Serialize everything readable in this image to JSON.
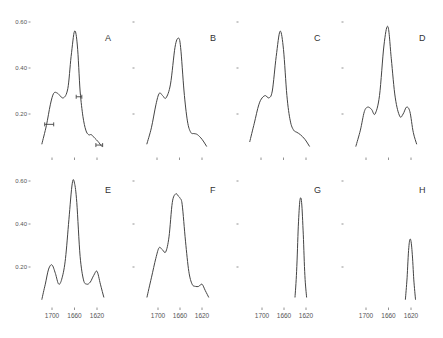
{
  "chart_data": {
    "type": "line",
    "title": "",
    "xlabel": "",
    "ylabel": "",
    "y_ticks": [
      "0.60",
      "0.40",
      "0.20"
    ],
    "x_ticks": [
      "1700",
      "1660",
      "1620"
    ],
    "x_tick_values": [
      1700,
      1660,
      1620
    ],
    "y_tick_values": [
      0.6,
      0.4,
      0.2
    ],
    "xlim": [
      1720,
      1605
    ],
    "ylim": [
      0.05,
      0.62
    ],
    "grid": false,
    "legend": null,
    "panels": [
      {
        "label": "A",
        "row": 0,
        "col": 0,
        "show_y_labels": true,
        "show_x_labels": false,
        "x": [
          1718,
          1710,
          1703,
          1697,
          1690,
          1680,
          1672,
          1666,
          1660,
          1655,
          1650,
          1645,
          1640,
          1635,
          1630,
          1624,
          1618,
          1612
        ],
        "y": [
          0.07,
          0.15,
          0.24,
          0.29,
          0.29,
          0.27,
          0.31,
          0.45,
          0.56,
          0.5,
          0.3,
          0.19,
          0.13,
          0.11,
          0.11,
          0.095,
          0.08,
          0.06
        ],
        "error_bars": [
          {
            "x": 1705,
            "y": 0.155,
            "xerr": 8
          },
          {
            "x": 1652,
            "y": 0.275,
            "xerr": 5
          },
          {
            "x": 1616,
            "y": 0.065,
            "xerr": 6
          }
        ]
      },
      {
        "label": "B",
        "row": 0,
        "col": 1,
        "show_y_labels": false,
        "show_x_labels": false,
        "x": [
          1718,
          1710,
          1702,
          1696,
          1690,
          1684,
          1676,
          1668,
          1662,
          1658,
          1652,
          1646,
          1640,
          1634,
          1628,
          1620,
          1612
        ],
        "y": [
          0.07,
          0.14,
          0.24,
          0.29,
          0.28,
          0.27,
          0.33,
          0.49,
          0.53,
          0.49,
          0.3,
          0.17,
          0.12,
          0.115,
          0.11,
          0.09,
          0.06
        ],
        "error_bars": []
      },
      {
        "label": "C",
        "row": 0,
        "col": 2,
        "show_y_labels": false,
        "show_x_labels": false,
        "x": [
          1720,
          1712,
          1704,
          1698,
          1692,
          1686,
          1680,
          1673,
          1666,
          1660,
          1654,
          1648,
          1642,
          1636,
          1630,
          1622,
          1614
        ],
        "y": [
          0.08,
          0.16,
          0.24,
          0.27,
          0.28,
          0.27,
          0.3,
          0.45,
          0.56,
          0.48,
          0.28,
          0.17,
          0.13,
          0.12,
          0.11,
          0.09,
          0.06
        ],
        "error_bars": []
      },
      {
        "label": "D",
        "row": 0,
        "col": 3,
        "show_y_labels": false,
        "show_x_labels": false,
        "x": [
          1718,
          1710,
          1703,
          1697,
          1690,
          1684,
          1676,
          1668,
          1661,
          1655,
          1648,
          1640,
          1634,
          1628,
          1622,
          1616,
          1610
        ],
        "y": [
          0.06,
          0.13,
          0.21,
          0.23,
          0.22,
          0.2,
          0.28,
          0.5,
          0.58,
          0.44,
          0.27,
          0.19,
          0.2,
          0.23,
          0.21,
          0.12,
          0.07
        ],
        "error_bars": []
      },
      {
        "label": "E",
        "row": 1,
        "col": 0,
        "show_y_labels": true,
        "show_x_labels": true,
        "x": [
          1718,
          1712,
          1706,
          1700,
          1694,
          1688,
          1682,
          1676,
          1670,
          1664,
          1660,
          1656,
          1650,
          1644,
          1638,
          1632,
          1626,
          1620,
          1614,
          1608
        ],
        "y": [
          0.05,
          0.12,
          0.19,
          0.21,
          0.17,
          0.12,
          0.15,
          0.24,
          0.42,
          0.59,
          0.59,
          0.5,
          0.25,
          0.14,
          0.12,
          0.13,
          0.16,
          0.18,
          0.12,
          0.06
        ],
        "error_bars": []
      },
      {
        "label": "F",
        "row": 1,
        "col": 1,
        "show_y_labels": false,
        "show_x_labels": true,
        "x": [
          1720,
          1712,
          1704,
          1698,
          1692,
          1686,
          1680,
          1674,
          1668,
          1663,
          1660,
          1656,
          1650,
          1644,
          1638,
          1632,
          1626,
          1620,
          1614,
          1608
        ],
        "y": [
          0.06,
          0.15,
          0.24,
          0.29,
          0.28,
          0.27,
          0.34,
          0.5,
          0.54,
          0.53,
          0.52,
          0.49,
          0.32,
          0.18,
          0.12,
          0.11,
          0.11,
          0.12,
          0.09,
          0.06
        ],
        "error_bars": []
      },
      {
        "label": "G",
        "row": 1,
        "col": 2,
        "show_y_labels": false,
        "show_x_labels": true,
        "x": [
          1640,
          1637,
          1634,
          1631,
          1628,
          1625,
          1622,
          1619
        ],
        "y": [
          0.06,
          0.18,
          0.39,
          0.51,
          0.5,
          0.35,
          0.16,
          0.06
        ],
        "error_bars": []
      },
      {
        "label": "H",
        "row": 1,
        "col": 3,
        "show_y_labels": false,
        "show_x_labels": true,
        "x": [
          1630,
          1627,
          1624,
          1621,
          1618,
          1615,
          1612
        ],
        "y": [
          0.05,
          0.15,
          0.29,
          0.33,
          0.27,
          0.14,
          0.05
        ],
        "error_bars": []
      }
    ]
  }
}
